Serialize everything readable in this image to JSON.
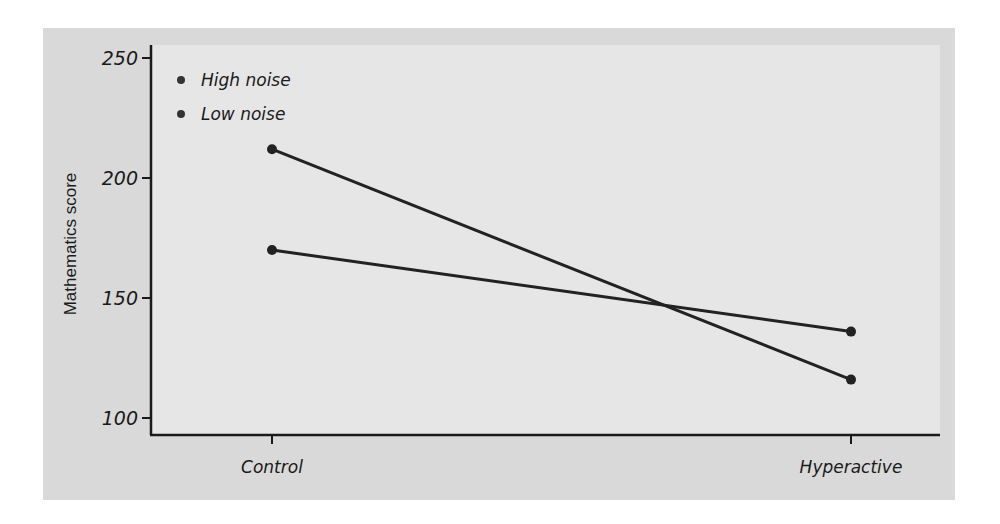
{
  "chart_data": {
    "type": "line",
    "title": "",
    "xlabel": "",
    "ylabel": "Mathematics score",
    "categories": [
      "Control",
      "Hyperactive"
    ],
    "series": [
      {
        "name": "High noise",
        "values": [
          212,
          116
        ]
      },
      {
        "name": "Low noise",
        "values": [
          170,
          136
        ]
      }
    ],
    "ylim": [
      100,
      250
    ],
    "yticks": [
      100,
      150,
      200,
      250
    ],
    "grid": false,
    "legend_position": "upper-left"
  },
  "colors": {
    "frame_bg": "#d9d9d9",
    "plot_bg": "#e6e6e6",
    "ink": "#1a1a1a"
  }
}
